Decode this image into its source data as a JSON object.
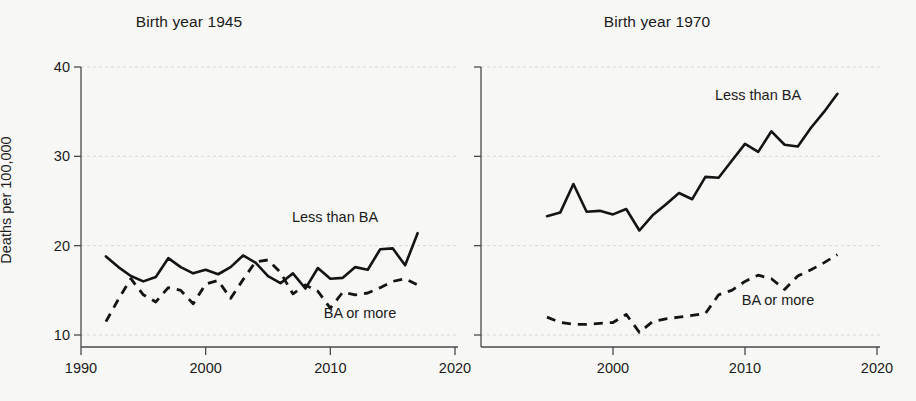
{
  "figure": {
    "background_color": "#f7f7f5",
    "ink_color": "#141414",
    "grid_color": "#cfcfcf"
  },
  "ylabel": "Deaths per 100,000",
  "panels": [
    {
      "title": "Birth year 1945",
      "series_label_solid": "Less than BA",
      "series_label_dashed": "BA or more",
      "xticks": [
        "1990",
        "2000",
        "2010",
        "2020"
      ],
      "yticks": [
        "10",
        "20",
        "30",
        "40"
      ]
    },
    {
      "title": "Birth year 1970",
      "series_label_solid": "Less than BA",
      "series_label_dashed": "BA or more",
      "xticks": [
        "2000",
        "2010",
        "2020"
      ],
      "yticks": [
        "",
        "",
        "",
        ""
      ]
    }
  ],
  "chart_data": [
    {
      "type": "line",
      "title": "Birth year 1945",
      "xlabel": "",
      "ylabel": "Deaths per 100,000",
      "xlim": [
        1990,
        2020
      ],
      "ylim": [
        10,
        40
      ],
      "xticks": [
        1990,
        2000,
        2010,
        2020
      ],
      "yticks": [
        10,
        20,
        30,
        40
      ],
      "grid": true,
      "legend": "inline annotations",
      "series": [
        {
          "name": "Less than BA",
          "style": "solid",
          "x": [
            1992,
            1993,
            1994,
            1995,
            1996,
            1997,
            1998,
            1999,
            2000,
            2001,
            2002,
            2003,
            2004,
            2005,
            2006,
            2007,
            2008,
            2009,
            2010,
            2011,
            2012,
            2013,
            2014,
            2015,
            2016,
            2017
          ],
          "values": [
            18.8,
            17.6,
            16.6,
            16.0,
            16.5,
            18.6,
            17.6,
            16.9,
            17.3,
            16.8,
            17.6,
            18.9,
            18.1,
            16.6,
            15.8,
            16.9,
            15.2,
            17.5,
            16.3,
            16.4,
            17.6,
            17.3,
            19.6,
            19.7,
            17.8,
            21.4
          ]
        },
        {
          "name": "BA or more",
          "style": "dashed",
          "x": [
            1992,
            1993,
            1994,
            1995,
            1996,
            1997,
            1998,
            1999,
            2000,
            2001,
            2002,
            2003,
            2004,
            2005,
            2006,
            2007,
            2008,
            2009,
            2010,
            2011,
            2012,
            2013,
            2014,
            2015,
            2016,
            2017
          ],
          "values": [
            11.5,
            14.0,
            16.3,
            14.5,
            13.7,
            15.3,
            15.0,
            13.5,
            15.7,
            16.1,
            14.1,
            16.2,
            18.2,
            18.4,
            17.0,
            14.6,
            15.6,
            14.9,
            13.0,
            14.8,
            14.5,
            14.7,
            15.3,
            16.0,
            16.3,
            15.6
          ]
        }
      ]
    },
    {
      "type": "line",
      "title": "Birth year 1970",
      "xlabel": "",
      "ylabel": "",
      "xlim": [
        1990,
        2020
      ],
      "ylim": [
        10,
        40
      ],
      "xticks": [
        2000,
        2010,
        2020
      ],
      "yticks": [
        10,
        20,
        30,
        40
      ],
      "grid": true,
      "legend": "inline annotations",
      "series": [
        {
          "name": "Less than BA",
          "style": "solid",
          "x": [
            1995,
            1996,
            1997,
            1998,
            1999,
            2000,
            2001,
            2002,
            2003,
            2004,
            2005,
            2006,
            2007,
            2008,
            2009,
            2010,
            2011,
            2012,
            2013,
            2014,
            2015,
            2016,
            2017
          ],
          "values": [
            23.3,
            23.7,
            26.9,
            23.8,
            23.9,
            23.5,
            24.1,
            21.7,
            23.4,
            24.6,
            25.9,
            25.2,
            27.7,
            27.6,
            29.5,
            31.4,
            30.5,
            32.8,
            31.3,
            31.1,
            33.2,
            35.0,
            37.0
          ]
        },
        {
          "name": "BA or more",
          "style": "dashed",
          "x": [
            1995,
            1996,
            1997,
            1998,
            1999,
            2000,
            2001,
            2002,
            2003,
            2004,
            2005,
            2006,
            2007,
            2008,
            2009,
            2010,
            2011,
            2012,
            2013,
            2014,
            2015,
            2016,
            2017
          ],
          "values": [
            12.0,
            11.4,
            11.2,
            11.2,
            11.3,
            11.4,
            12.3,
            10.3,
            11.5,
            11.8,
            12.0,
            12.2,
            12.4,
            14.5,
            15.0,
            16.0,
            16.7,
            16.3,
            15.1,
            16.6,
            17.3,
            18.1,
            19.0
          ]
        }
      ]
    }
  ]
}
